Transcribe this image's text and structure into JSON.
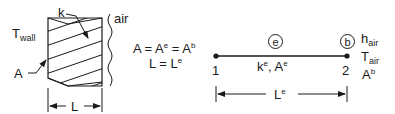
{
  "wall_figure": {
    "t_wall_label": "T",
    "t_wall_sub": "wall",
    "k_label": "k",
    "air_label": "air",
    "a_label": "A",
    "l_label": "L"
  },
  "equations": {
    "line1_a": "A = A",
    "line1_e": "e",
    "line1_mid": " = A",
    "line1_b": "b",
    "line2_l": "L = L",
    "line2_e": "e"
  },
  "element_model": {
    "element_circle": "e",
    "boundary_circle": "b",
    "node1": "1",
    "node2": "2",
    "props_k": "k",
    "props_k_sup": "e",
    "props_a": ", A",
    "props_a_sup": "e",
    "length_label": "L",
    "length_sup": "e",
    "h_label": "h",
    "h_sub": "air",
    "t_label": "T",
    "t_sub": "air",
    "ab_label": "A",
    "ab_sup": "b"
  },
  "colors": {
    "ink": "#1a1a1a",
    "background": "#ffffff"
  }
}
